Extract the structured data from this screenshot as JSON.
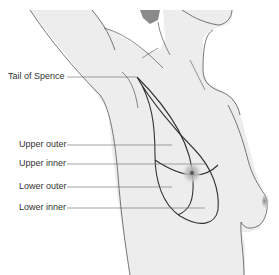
{
  "figure": {
    "labels": [
      {
        "id": "tail",
        "text": "Tail of Spence"
      },
      {
        "id": "upper-outer",
        "text": "Upper outer"
      },
      {
        "id": "upper-inner",
        "text": "Upper inner"
      },
      {
        "id": "lower-outer",
        "text": "Lower outer"
      },
      {
        "id": "lower-inner",
        "text": "Lower inner"
      }
    ]
  },
  "colors": {
    "skin": "#ededed",
    "outline": "#555555",
    "quadrant_line": "#333333",
    "leader_line": "#666666",
    "areola": "#b9b9b9",
    "hair_shadow": "#8a8a8a"
  }
}
